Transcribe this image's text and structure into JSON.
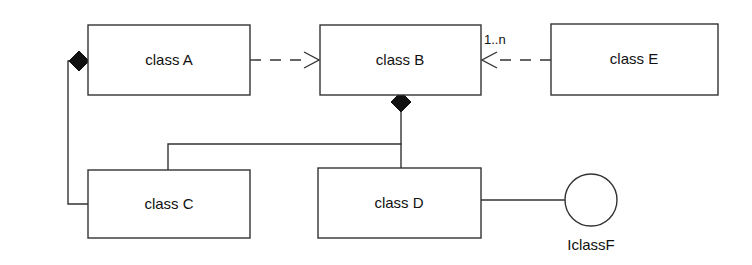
{
  "diagram": {
    "type": "uml-class-diagram",
    "canvas": {
      "width": 752,
      "height": 265,
      "background": "#ffffff"
    },
    "stroke_color": "#333333",
    "fill_color": "#ffffff",
    "text_color": "#111111",
    "classes": [
      {
        "id": "A",
        "label": "class A",
        "x": 88,
        "y": 25,
        "w": 162,
        "h": 70
      },
      {
        "id": "B",
        "label": "class B",
        "x": 320,
        "y": 25,
        "w": 161,
        "h": 70
      },
      {
        "id": "E",
        "label": "class E",
        "x": 551,
        "y": 24,
        "w": 167,
        "h": 71
      },
      {
        "id": "C",
        "label": "class C",
        "x": 88,
        "y": 170,
        "w": 162,
        "h": 68
      },
      {
        "id": "D",
        "label": "class D",
        "x": 318,
        "y": 168,
        "w": 163,
        "h": 70
      }
    ],
    "interfaces": [
      {
        "id": "IclassF",
        "label": "IclassF",
        "cx": 591,
        "cy": 200,
        "r": 26,
        "label_x": 591,
        "label_y": 246
      }
    ],
    "relationships": [
      {
        "id": "a-composes-c",
        "kind": "composition",
        "from": "A",
        "to": "C",
        "style": "solid",
        "diamond_end": "A",
        "label": ""
      },
      {
        "id": "a-depends-b",
        "kind": "dependency",
        "from": "A",
        "to": "B",
        "style": "dashed",
        "arrow_end": "B",
        "label": ""
      },
      {
        "id": "e-depends-b",
        "kind": "dependency",
        "from": "E",
        "to": "B",
        "style": "dashed",
        "arrow_end": "B",
        "label": "1..n"
      },
      {
        "id": "b-composes-c-d",
        "kind": "composition",
        "from": "B",
        "to": "C, D",
        "style": "solid",
        "diamond_end": "B",
        "label": ""
      },
      {
        "id": "d-provides-iclassf",
        "kind": "interface-realization",
        "from": "D",
        "to": "IclassF",
        "style": "solid",
        "label": ""
      }
    ],
    "multiplicities": [
      {
        "id": "b-e-mult",
        "text": "1..n",
        "x": 484,
        "y": 40
      }
    ]
  }
}
